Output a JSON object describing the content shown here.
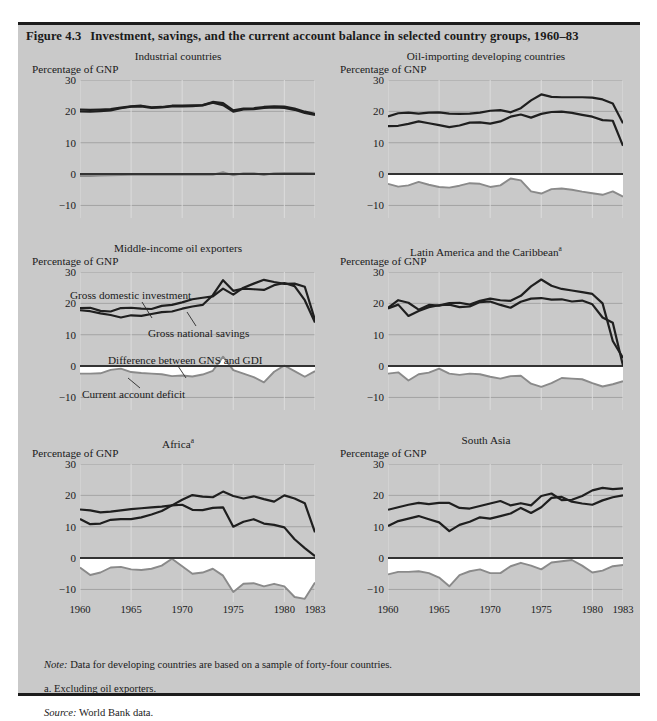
{
  "figure": {
    "number": "Figure 4.3",
    "title": "Investment, savings, and the current account balance in selected country groups, 1960–83"
  },
  "axis": {
    "unit_label": "Percentage of GNP",
    "yticks": [
      "30",
      "20",
      "10",
      "0",
      "−10"
    ],
    "ytick_values": [
      30,
      20,
      10,
      0,
      -10
    ],
    "xticks": [
      "1960",
      "1965",
      "1970",
      "1975",
      "1980",
      "1983"
    ],
    "xtick_values": [
      1960,
      1965,
      1970,
      1975,
      1980,
      1983
    ],
    "ylim": [
      -14,
      30
    ],
    "xlim": [
      1960,
      1983
    ]
  },
  "annotations": {
    "gdi": "Gross domestic investment",
    "gns": "Gross national savings",
    "difference": "Difference between GNS and GDI",
    "deficit": "Current account deficit"
  },
  "colors": {
    "panel_background": "#c9c9c9",
    "rule": "#1c1c1c",
    "investment_line": "#1f1f1f",
    "savings_line": "#1f1f1f",
    "deficit_line": "#8a8a8a",
    "deficit_fill": "#ffffff",
    "gridline": "#9a9a9a",
    "axis_zero": "#333333"
  },
  "notes": [
    {
      "lead": "Note:",
      "text": " Data for developing countries are based on a sample of forty-four countries.",
      "italic_lead": true
    },
    {
      "lead": "a.",
      "text": "  Excluding oil exporters.",
      "italic_lead": false
    },
    {
      "lead": "Source:",
      "text": " World Bank data.",
      "italic_lead": true
    }
  ],
  "chart_data": {
    "type": "line",
    "title": "Investment, savings, and the current account balance in selected country groups, 1960–83",
    "xlabel": "",
    "ylabel": "Percentage of GNP",
    "ylim": [
      -14,
      30
    ],
    "xlim": [
      1960,
      1983
    ],
    "grid": true,
    "legend": "inline-annotations",
    "x": [
      1960,
      1961,
      1962,
      1963,
      1964,
      1965,
      1966,
      1967,
      1968,
      1969,
      1970,
      1971,
      1972,
      1973,
      1974,
      1975,
      1976,
      1977,
      1978,
      1979,
      1980,
      1981,
      1982,
      1983
    ],
    "panels": [
      {
        "name": "Industrial countries",
        "footnote": "",
        "series": [
          {
            "name": "Gross domestic investment",
            "values": [
              20.6,
              20.5,
              20.6,
              20.7,
              21.2,
              21.6,
              21.8,
              21.3,
              21.4,
              21.8,
              21.8,
              21.9,
              22.0,
              23.0,
              22.6,
              20.3,
              20.9,
              21.0,
              21.4,
              21.6,
              21.5,
              20.9,
              19.9,
              19.2
            ]
          },
          {
            "name": "Gross national savings",
            "values": [
              20.0,
              19.9,
              20.1,
              20.3,
              21.0,
              21.5,
              21.6,
              21.1,
              21.3,
              21.6,
              21.6,
              21.7,
              21.9,
              22.8,
              22.0,
              19.9,
              20.6,
              20.7,
              21.1,
              21.3,
              21.1,
              20.5,
              19.5,
              18.9
            ]
          },
          {
            "name": "Current account deficit",
            "values": [
              -0.6,
              -0.6,
              -0.5,
              -0.4,
              -0.3,
              -0.2,
              -0.2,
              -0.2,
              -0.2,
              -0.2,
              -0.2,
              -0.2,
              -0.2,
              -0.2,
              0.6,
              -0.4,
              0.3,
              0.3,
              -0.3,
              0.3,
              0.4,
              0.4,
              0.4,
              0.3
            ]
          }
        ]
      },
      {
        "name": "Oil-importing developing countries",
        "footnote": "",
        "series": [
          {
            "name": "Gross domestic investment",
            "values": [
              18.4,
              19.4,
              19.6,
              19.3,
              19.6,
              19.7,
              19.3,
              19.2,
              19.3,
              19.6,
              20.2,
              20.4,
              19.7,
              21.0,
              23.5,
              25.4,
              24.6,
              24.5,
              24.5,
              24.5,
              24.4,
              23.8,
              22.5,
              16.2
            ]
          },
          {
            "name": "Gross national savings",
            "values": [
              15.3,
              15.4,
              16.0,
              16.8,
              16.2,
              15.6,
              15.0,
              15.5,
              16.4,
              16.5,
              16.1,
              16.8,
              18.3,
              19.0,
              18.0,
              19.2,
              19.8,
              19.9,
              19.5,
              18.9,
              18.3,
              17.2,
              17.0,
              9.0
            ]
          },
          {
            "name": "Current account deficit",
            "values": [
              -3.1,
              -4.0,
              -3.6,
              -2.5,
              -3.4,
              -4.1,
              -4.3,
              -3.7,
              -2.9,
              -3.1,
              -4.1,
              -3.6,
              -1.4,
              -2.0,
              -5.5,
              -6.2,
              -4.8,
              -4.6,
              -5.0,
              -5.6,
              -6.1,
              -6.6,
              -5.5,
              -7.2
            ]
          }
        ]
      },
      {
        "name": "Middle-income oil exporters",
        "footnote": "",
        "series": [
          {
            "name": "Gross domestic investment",
            "values": [
              18.5,
              18.6,
              17.6,
              17.4,
              18.5,
              18.6,
              18.3,
              18.2,
              19.2,
              19.5,
              20.3,
              21.3,
              21.8,
              22.2,
              24.7,
              22.8,
              25.0,
              26.3,
              27.5,
              26.8,
              26.2,
              26.3,
              25.3,
              14.7
            ]
          },
          {
            "name": "Gross national savings",
            "values": [
              17.8,
              17.5,
              16.8,
              16.3,
              15.5,
              16.2,
              16.0,
              16.6,
              17.2,
              17.4,
              18.3,
              19.0,
              19.5,
              22.6,
              27.4,
              24.0,
              24.7,
              24.5,
              24.3,
              25.8,
              26.5,
              25.5,
              21.0,
              13.9
            ]
          },
          {
            "name": "Difference between GNS and GDI",
            "values": [
              -2.4,
              -2.4,
              -2.3,
              -1.2,
              -0.8,
              -1.9,
              -2.2,
              -2.4,
              -2.6,
              -3.2,
              -3.0,
              -3.3,
              -2.7,
              -1.5,
              3.0,
              -1.3,
              -2.4,
              -3.5,
              -5.2,
              -1.8,
              0.2,
              -1.6,
              -3.4,
              -1.6
            ]
          }
        ]
      },
      {
        "name": "Latin America and the Caribbean",
        "footnote": "a",
        "series": [
          {
            "name": "Gross domestic investment",
            "values": [
              18.6,
              21.0,
              20.2,
              18.0,
              19.5,
              19.3,
              20.1,
              20.2,
              19.6,
              20.8,
              21.5,
              21.0,
              20.8,
              22.4,
              25.4,
              27.6,
              25.6,
              24.6,
              24.1,
              23.6,
              23.0,
              20.0,
              8.0,
              2.6
            ]
          },
          {
            "name": "Gross national savings",
            "values": [
              18.4,
              19.6,
              16.0,
              17.6,
              18.8,
              19.4,
              19.6,
              18.8,
              19.0,
              20.4,
              20.6,
              19.5,
              18.6,
              20.5,
              21.5,
              21.7,
              21.2,
              21.3,
              20.6,
              20.9,
              19.7,
              15.5,
              13.8,
              0.1
            ]
          },
          {
            "name": "Current account deficit",
            "values": [
              -2.4,
              -2.0,
              -4.6,
              -2.6,
              -2.1,
              -0.8,
              -2.4,
              -2.8,
              -2.4,
              -2.6,
              -3.4,
              -4.0,
              -3.2,
              -3.1,
              -5.6,
              -6.6,
              -5.4,
              -3.8,
              -4.0,
              -4.2,
              -5.4,
              -6.5,
              -5.8,
              -4.8
            ]
          }
        ]
      },
      {
        "name": "Africa",
        "footnote": "a",
        "series": [
          {
            "name": "Gross domestic investment",
            "values": [
              15.5,
              15.2,
              14.6,
              14.8,
              15.2,
              15.6,
              15.9,
              16.2,
              16.4,
              16.8,
              18.6,
              20.1,
              19.6,
              19.4,
              21.2,
              19.8,
              19.0,
              19.7,
              18.8,
              18.0,
              20.0,
              19.0,
              17.5,
              8.2
            ]
          },
          {
            "name": "Gross national savings",
            "values": [
              12.5,
              10.8,
              11.0,
              12.2,
              12.4,
              12.4,
              13.0,
              13.9,
              15.0,
              16.8,
              17.0,
              15.4,
              15.3,
              16.0,
              16.2,
              10.0,
              11.6,
              12.4,
              11.0,
              10.6,
              9.8,
              6.0,
              3.2,
              0.6
            ]
          },
          {
            "name": "Current account deficit",
            "values": [
              -3.0,
              -5.4,
              -4.6,
              -3.0,
              -2.8,
              -3.6,
              -3.8,
              -3.4,
              -2.4,
              -0.2,
              -2.6,
              -5.0,
              -4.6,
              -3.4,
              -5.6,
              -10.8,
              -8.2,
              -8.0,
              -9.0,
              -8.2,
              -9.0,
              -12.4,
              -13.0,
              -7.8
            ]
          }
        ]
      },
      {
        "name": "South Asia",
        "footnote": "",
        "series": [
          {
            "name": "Gross domestic investment",
            "values": [
              15.4,
              16.2,
              17.0,
              17.6,
              17.2,
              17.6,
              17.6,
              16.0,
              15.8,
              16.6,
              17.4,
              18.2,
              16.8,
              17.5,
              16.8,
              19.8,
              20.6,
              18.5,
              18.6,
              19.8,
              21.6,
              22.4,
              22.0,
              22.2
            ]
          },
          {
            "name": "Gross national savings",
            "values": [
              10.2,
              11.8,
              12.6,
              13.4,
              12.4,
              11.4,
              8.6,
              10.6,
              11.6,
              13.0,
              12.6,
              13.4,
              14.2,
              16.0,
              14.4,
              16.2,
              19.2,
              19.5,
              18.0,
              17.4,
              17.0,
              18.4,
              19.4,
              20.0
            ]
          },
          {
            "name": "Current account deficit",
            "values": [
              -5.2,
              -4.4,
              -4.4,
              -4.2,
              -4.8,
              -6.2,
              -9.0,
              -5.4,
              -4.2,
              -3.6,
              -4.8,
              -4.8,
              -2.6,
              -1.5,
              -2.4,
              -3.6,
              -1.4,
              -1.0,
              -0.6,
              -2.4,
              -4.6,
              -4.0,
              -2.6,
              -2.2
            ]
          }
        ]
      }
    ]
  }
}
